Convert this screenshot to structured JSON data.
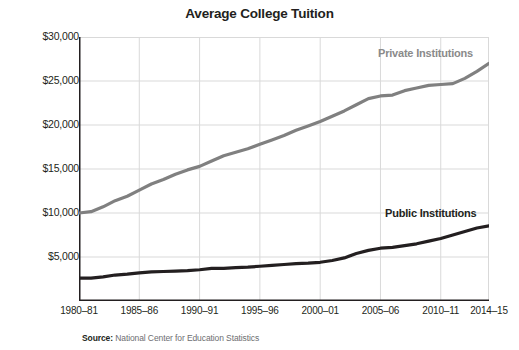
{
  "chart_data": {
    "type": "line",
    "title": "Average College Tuition",
    "xlabel": "",
    "ylabel": "Constant 2014–15 dollars",
    "grid": true,
    "legend_position": "inline-labels",
    "ylim": [
      0,
      30000
    ],
    "yticks": [
      30000,
      25000,
      20000,
      15000,
      10000,
      5000
    ],
    "ytick_labels": [
      "$30,000",
      "$25,000",
      "$20,000",
      "$15,000",
      "$10,000",
      "$5,000"
    ],
    "xticks": [
      "1980–81",
      "1985–86",
      "1990–91",
      "1995–96",
      "2000–01",
      "2005–06",
      "2010–11",
      "2014–15"
    ],
    "x": [
      "1980–81",
      "1981–82",
      "1982–83",
      "1983–84",
      "1984–85",
      "1985–86",
      "1986–87",
      "1987–88",
      "1988–89",
      "1989–90",
      "1990–91",
      "1991–92",
      "1992–93",
      "1993–94",
      "1994–95",
      "1995–96",
      "1996–97",
      "1997–98",
      "1998–99",
      "1999–00",
      "2000–01",
      "2001–02",
      "2002–03",
      "2003–04",
      "2004–05",
      "2005–06",
      "2006–07",
      "2007–08",
      "2008–09",
      "2009–10",
      "2010–11",
      "2011–12",
      "2012–13",
      "2013–14",
      "2014–15"
    ],
    "series": [
      {
        "name": "Private Institutions",
        "color": "#808080",
        "values": [
          10000,
          10150,
          10700,
          11400,
          11900,
          12600,
          13300,
          13800,
          14400,
          14900,
          15300,
          15900,
          16500,
          16900,
          17300,
          17800,
          18300,
          18800,
          19400,
          19900,
          20400,
          21000,
          21600,
          22300,
          23000,
          23300,
          23400,
          23900,
          24200,
          24500,
          24600,
          24700,
          25300,
          26100,
          27000
        ]
      },
      {
        "name": "Public Institutions",
        "color": "#231f20",
        "values": [
          2600,
          2600,
          2750,
          2950,
          3050,
          3200,
          3300,
          3350,
          3400,
          3450,
          3550,
          3700,
          3700,
          3800,
          3850,
          3950,
          4050,
          4150,
          4250,
          4300,
          4400,
          4600,
          4900,
          5400,
          5750,
          6000,
          6100,
          6300,
          6500,
          6800,
          7100,
          7500,
          7900,
          8300,
          8550
        ]
      }
    ],
    "annotations": [
      {
        "text": "Private Institutions",
        "series": "Private Institutions"
      },
      {
        "text": "Public Institutions",
        "series": "Public Institutions"
      }
    ],
    "source_prefix": "Source:",
    "source_text": "National Center for Education Statistics"
  },
  "colors": {
    "private": "#808080",
    "public": "#231f20",
    "grid": "#d9d9d9",
    "axis": "#231f20",
    "text": "#231f20",
    "source": "#6d6e71",
    "background": "#ffffff"
  }
}
